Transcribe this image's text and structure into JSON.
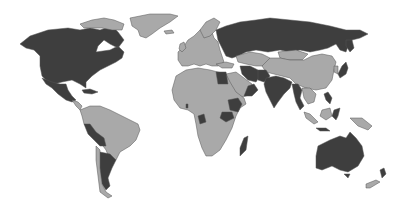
{
  "map": {
    "type": "world-choropleth",
    "projection": "equirectangular-like",
    "colors": {
      "highlighted": "#3e3e3e",
      "other": "#a9a9a9",
      "border": "#555555",
      "ocean": "#ffffff"
    },
    "highlighted_regions": [
      "Canada",
      "United States",
      "Mexico",
      "Cuba",
      "Peru",
      "Bolivia",
      "Argentina",
      "Russia",
      "Egypt",
      "Iran",
      "Pakistan",
      "Oman",
      "Yemen",
      "Ethiopia",
      "Kenya",
      "Gabon",
      "Madagascar",
      "India",
      "Myanmar",
      "Thailand",
      "Japan",
      "Philippines",
      "Sulawesi",
      "Australia",
      "New Zealand (South Island)"
    ],
    "other_regions": [
      "Greenland",
      "Europe",
      "Africa (rest)",
      "Middle East (rest)",
      "China",
      "Mongolia",
      "Kazakhstan",
      "Brazil",
      "Colombia",
      "Venezuela",
      "Chile",
      "Indonesia",
      "Papua New Guinea",
      "Malaysia"
    ]
  }
}
